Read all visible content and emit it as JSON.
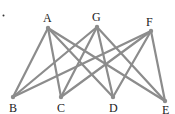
{
  "diagram": {
    "type": "bipartite-graph",
    "colors": {
      "edge": "#8c8c8c",
      "node": "#8c8c8c",
      "label": "#222222"
    },
    "stray_mark": {
      "x": 3.5,
      "y": 15.5
    },
    "nodes": [
      {
        "id": "A",
        "label": "A",
        "x": 48,
        "y": 28,
        "lx": 43,
        "ly": 22
      },
      {
        "id": "G",
        "label": "G",
        "x": 97,
        "y": 27,
        "lx": 92,
        "ly": 21
      },
      {
        "id": "F",
        "label": "F",
        "x": 151,
        "y": 31,
        "lx": 146,
        "ly": 26
      },
      {
        "id": "B",
        "label": "B",
        "x": 13,
        "y": 97,
        "lx": 9,
        "ly": 112
      },
      {
        "id": "C",
        "label": "C",
        "x": 61,
        "y": 97,
        "lx": 57,
        "ly": 112
      },
      {
        "id": "D",
        "label": "D",
        "x": 113,
        "y": 97,
        "lx": 109,
        "ly": 112
      },
      {
        "id": "E",
        "label": "E",
        "x": 165,
        "y": 101,
        "lx": 162,
        "ly": 114
      }
    ],
    "edges": [
      [
        "A",
        "B"
      ],
      [
        "A",
        "C"
      ],
      [
        "A",
        "D"
      ],
      [
        "A",
        "E"
      ],
      [
        "G",
        "B"
      ],
      [
        "G",
        "C"
      ],
      [
        "G",
        "D"
      ],
      [
        "G",
        "E"
      ],
      [
        "F",
        "B"
      ],
      [
        "F",
        "C"
      ],
      [
        "F",
        "D"
      ],
      [
        "F",
        "E"
      ]
    ]
  }
}
